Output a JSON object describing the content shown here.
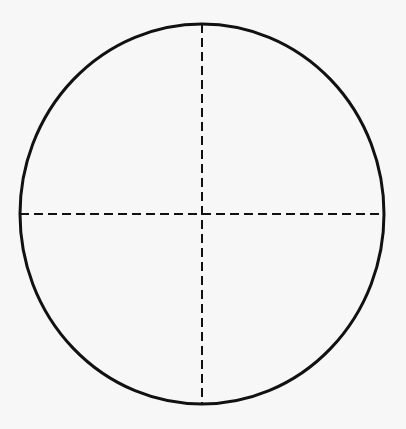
{
  "diagram": {
    "type": "circle-with-crosshair",
    "background": "#f7f7f7",
    "stroke": "#111111",
    "ellipse": {
      "cx": 202,
      "cy": 214,
      "rx": 182,
      "ry": 190,
      "stroke_width": 3
    },
    "crosshair": {
      "horizontal": {
        "x1": 20,
        "y1": 214,
        "x2": 384,
        "y2": 214
      },
      "vertical": {
        "x1": 202,
        "y1": 24,
        "x2": 202,
        "y2": 404
      },
      "dash": "9 5",
      "stroke_width": 2
    }
  }
}
